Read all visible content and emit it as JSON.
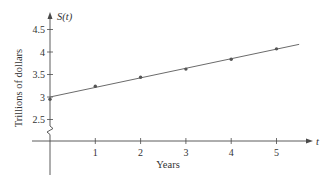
{
  "chart_data": {
    "type": "scatter",
    "title": "",
    "xlabel": "Years",
    "ylabel": "Trillions of dollars",
    "x_axis_symbol": "t",
    "y_axis_symbol": "S(t)",
    "x": [
      0,
      1,
      2,
      3,
      4,
      5
    ],
    "series": [
      {
        "name": "data points",
        "kind": "scatter",
        "x": [
          0,
          1,
          2,
          3,
          4,
          5
        ],
        "values": [
          2.95,
          3.24,
          3.44,
          3.62,
          3.84,
          4.07
        ]
      },
      {
        "name": "regression line",
        "kind": "line",
        "x": [
          0,
          5.5
        ],
        "values": [
          3.0,
          4.17
        ]
      }
    ],
    "x_ticks": [
      1,
      2,
      3,
      4,
      5
    ],
    "y_ticks": [
      2.5,
      3,
      3.5,
      4,
      4.5
    ],
    "y_tick_labels": [
      "2.5",
      "3",
      "3.5",
      "4",
      "4.5"
    ],
    "xlim": [
      0,
      5.8
    ],
    "ylim": [
      2.5,
      4.9
    ],
    "y_axis_break": true,
    "grid": false,
    "legend": null
  },
  "colors": {
    "axis": "#4a4a4a",
    "line": "#6b6b6b",
    "point": "#555555",
    "text": "#333333"
  }
}
